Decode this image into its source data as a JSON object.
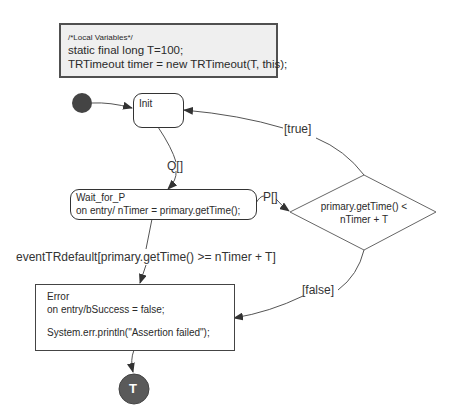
{
  "diagram": {
    "type": "UML state machine",
    "local_variables": {
      "comment": "/*Local Variables*/",
      "lines": [
        "static final long T=100;",
        "TRTimeout timer = new TRTimeout(T, this);"
      ]
    },
    "states": {
      "init": {
        "name": "Init"
      },
      "wait_for_p": {
        "name": "Wait_for_P",
        "entry": "on entry/ nTimer = primary.getTime();"
      },
      "error": {
        "name": "Error",
        "entry": "on entry/bSuccess = false;",
        "action": "System.err.println(\"Assertion failed\");"
      },
      "final": {
        "label": "T"
      }
    },
    "choice": {
      "condition_line1": "primary.getTime() <",
      "condition_line2": "nTimer + T"
    },
    "transitions": {
      "init_to_wait": "Q[]",
      "wait_to_choice": "P[]",
      "wait_to_error": "eventTRdefault[primary.getTime() >= nTimer + T]",
      "choice_true": "[true]",
      "choice_false": "[false]"
    },
    "colors": {
      "line": "#444444",
      "node_fill": "#555555",
      "vars_bg": "#efefef"
    }
  }
}
